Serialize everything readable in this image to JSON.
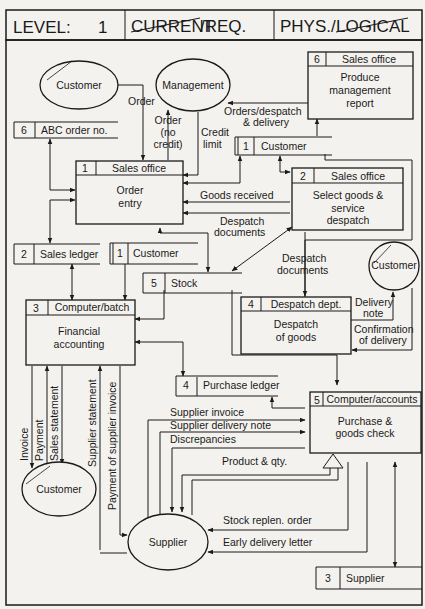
{
  "header": {
    "level_label": "LEVEL:",
    "level_value": "1",
    "current_label": "CURRENT",
    "req_label": "/REQ.",
    "phys_label": "PHYS./",
    "logical_label": "LOGICAL"
  },
  "external_entities": {
    "customer_top": "Customer",
    "management": "Management",
    "customer_right": "Customer",
    "customer_bottom": "Customer",
    "supplier": "Supplier"
  },
  "processes": [
    {
      "id": "1",
      "location": "Sales office",
      "name_line1": "Order",
      "name_line2": "entry"
    },
    {
      "id": "2",
      "location": "Sales office",
      "name_line1": "Select goods &",
      "name_line2": "service",
      "name_line3": "despatch"
    },
    {
      "id": "3",
      "location": "Computer/batch",
      "name_line1": "Financial",
      "name_line2": "accounting"
    },
    {
      "id": "4",
      "location": "Despatch dept.",
      "name_line1": "Despatch",
      "name_line2": "of goods"
    },
    {
      "id": "5",
      "location": "Computer/accounts",
      "name_line1": "Purchase &",
      "name_line2": "goods check"
    },
    {
      "id": "6",
      "location": "Sales office",
      "name_line1": "Produce",
      "name_line2": "management",
      "name_line3": "report"
    }
  ],
  "data_stores": {
    "abc_order": {
      "id": "6",
      "name": "ABC order no."
    },
    "customer_upper": {
      "id": "1",
      "name": "Customer"
    },
    "sales_ledger": {
      "id": "2",
      "name": "Sales ledger"
    },
    "customer_lower": {
      "id": "1",
      "name": "Customer"
    },
    "stock": {
      "id": "5",
      "name": "Stock"
    },
    "purchase_ledger": {
      "id": "4",
      "name": "Purchase ledger"
    },
    "supplier": {
      "id": "3",
      "name": "Supplier"
    }
  },
  "flows": {
    "order": "Order",
    "order_no_credit_1": "Order",
    "order_no_credit_2": "(no",
    "order_no_credit_3": "credit)",
    "credit_limit_1": "Credit",
    "credit_limit_2": "limit",
    "orders_despatch_1": "Orders/despatch",
    "orders_despatch_2": "& delivery",
    "goods_received": "Goods received",
    "despatch_docs_1a": "Despatch",
    "despatch_docs_1b": "documents",
    "despatch_docs_2a": "Despatch",
    "despatch_docs_2b": "documents",
    "delivery_note_1": "Delivery",
    "delivery_note_2": "note",
    "confirmation_1": "Confirmation",
    "confirmation_2": "of delivery",
    "invoice": "Invoice",
    "payment": "Payment",
    "sales_statement": "Sales statement",
    "supplier_statement": "Supplier statement",
    "payment_supplier_invoice": "Payment of supplier invoice",
    "supplier_invoice": "Supplier invoice",
    "supplier_delivery_note": "Supplier delivery note",
    "discrepancies": "Discrepancies",
    "product_qty": "Product & qty.",
    "stock_replen": "Stock replen. order",
    "early_delivery": "Early delivery letter"
  }
}
